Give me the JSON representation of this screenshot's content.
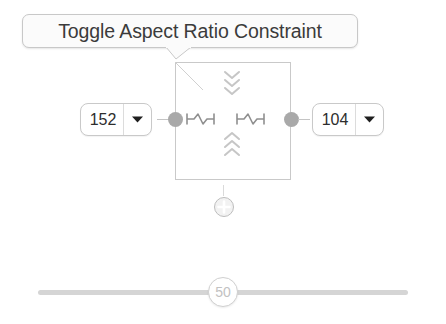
{
  "tooltip": {
    "label": "Toggle Aspect Ratio Constraint"
  },
  "width_stepper": {
    "value": "152",
    "icon": "chevron-down-icon"
  },
  "height_stepper": {
    "value": "104",
    "icon": "chevron-down-icon"
  },
  "constraint_widget": {
    "inner_top_chevrons": "chevron-down-icon",
    "inner_bottom_chevrons": "chevron-up-icon",
    "left_spring": "spring-icon",
    "right_spring": "spring-icon",
    "left_anchor": "anchor-dot",
    "right_anchor": "anchor-dot"
  },
  "add_button": {
    "icon": "plus-circle-icon"
  },
  "slider": {
    "value": "50",
    "min": "0",
    "max": "100",
    "percent": 50
  },
  "colors": {
    "border": "#c9c9c9",
    "anchor": "#a9a9a9",
    "track": "#d5d5d5",
    "text": "#3b3b3b",
    "muted": "#c2c2c2"
  }
}
